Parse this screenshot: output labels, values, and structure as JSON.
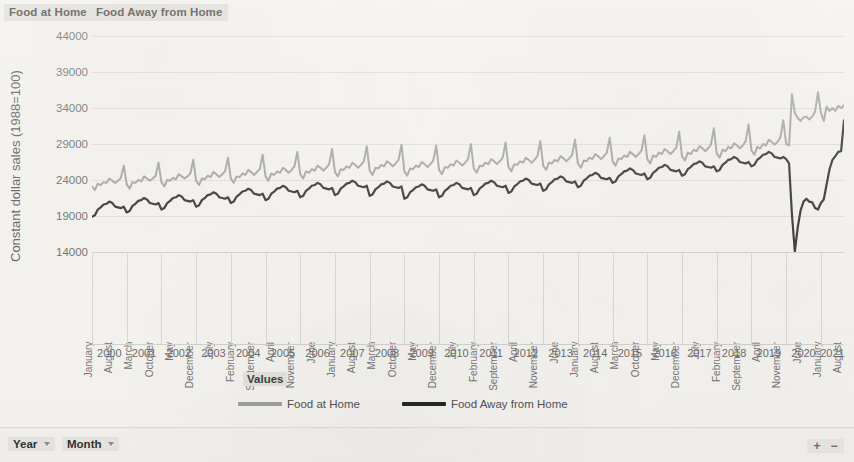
{
  "header": {
    "series_labels": [
      "Food at Home",
      "Food Away from Home"
    ]
  },
  "axes": {
    "y_title": "Constant dollar sales (1988=100)",
    "values_label": "Values"
  },
  "field_bar": {
    "fields": [
      "Year",
      "Month"
    ],
    "zoom_in": "+",
    "zoom_out": "−"
  },
  "chart_data": {
    "type": "line",
    "title": "",
    "xlabel": "",
    "ylabel": "Constant dollar sales (1988=100)",
    "ylim": [
      14000,
      44000
    ],
    "yticks": [
      14000,
      19000,
      24000,
      29000,
      34000,
      39000,
      44000
    ],
    "grid": true,
    "legend_position": "bottom",
    "x_axis": {
      "fields": [
        "Year",
        "Month"
      ],
      "years": [
        2000,
        2001,
        2002,
        2003,
        2004,
        2005,
        2006,
        2007,
        2008,
        2009,
        2010,
        2011,
        2012,
        2013,
        2014,
        2015,
        2016,
        2017,
        2018,
        2019,
        2020,
        2021
      ],
      "month_tick_labels": [
        "January",
        "August",
        "March",
        "October",
        "May",
        "December",
        "July",
        "February",
        "September",
        "April",
        "November",
        "June",
        "January",
        "August",
        "March",
        "October",
        "May",
        "December",
        "July",
        "February",
        "September",
        "April",
        "November",
        "June",
        "January",
        "August",
        "March",
        "October",
        "May",
        "December",
        "July",
        "February",
        "September",
        "April",
        "November",
        "June",
        "January",
        "August"
      ],
      "start": "2000-01",
      "end": "2021-09",
      "points_per_year": 12
    },
    "colors": {
      "food_at_home": "#9b9b9b",
      "food_away_from_home": "#1c1c1c"
    },
    "series": [
      {
        "name": "Food at Home",
        "color": "#9b9b9b",
        "values": [
          23100,
          22600,
          23500,
          23300,
          23700,
          23600,
          24200,
          23900,
          23600,
          23900,
          24300,
          26000,
          23400,
          22800,
          23700,
          23600,
          24000,
          23800,
          24500,
          24200,
          23900,
          24200,
          24600,
          26400,
          23700,
          23100,
          24000,
          23900,
          24300,
          24100,
          24800,
          24500,
          24200,
          24500,
          24900,
          26800,
          23900,
          23300,
          24200,
          24100,
          24600,
          24400,
          25100,
          24800,
          24400,
          24800,
          25200,
          27100,
          24200,
          23600,
          24500,
          24400,
          24900,
          24700,
          25400,
          25100,
          24700,
          25100,
          25500,
          27500,
          24500,
          23900,
          24900,
          24700,
          25200,
          25000,
          25700,
          25400,
          25000,
          25400,
          25900,
          27900,
          24800,
          24200,
          25200,
          25000,
          25500,
          25300,
          26000,
          25700,
          25300,
          25700,
          26200,
          28300,
          25100,
          24500,
          25500,
          25400,
          25900,
          25700,
          26400,
          26100,
          25700,
          26100,
          26600,
          28700,
          25300,
          24700,
          25700,
          25600,
          26100,
          25900,
          26600,
          26300,
          25900,
          26300,
          26800,
          28900,
          25200,
          24600,
          25600,
          25500,
          26000,
          25800,
          26500,
          26200,
          25800,
          26200,
          26700,
          28800,
          25400,
          24800,
          25800,
          25700,
          26200,
          26000,
          26700,
          26400,
          26000,
          26400,
          26900,
          29000,
          25600,
          25000,
          26000,
          25900,
          26400,
          26200,
          26900,
          26600,
          26200,
          26600,
          27100,
          29200,
          25800,
          25200,
          26200,
          26100,
          26600,
          26400,
          27100,
          26800,
          26400,
          26800,
          27300,
          29400,
          26000,
          25400,
          26400,
          26300,
          26800,
          26600,
          27300,
          27000,
          26600,
          27000,
          27500,
          29600,
          26300,
          25700,
          26700,
          26600,
          27100,
          26900,
          27600,
          27300,
          26900,
          27300,
          27800,
          29900,
          26600,
          26000,
          27000,
          26900,
          27400,
          27200,
          27900,
          27600,
          27200,
          27600,
          28100,
          30200,
          26900,
          26300,
          27400,
          27200,
          27800,
          27600,
          28300,
          28000,
          27600,
          28000,
          28500,
          30700,
          27300,
          26700,
          27800,
          27600,
          28200,
          28000,
          28700,
          28400,
          28000,
          28400,
          28900,
          31200,
          27700,
          27100,
          28200,
          28000,
          28600,
          28400,
          29100,
          28800,
          28400,
          28800,
          29400,
          31700,
          28100,
          27500,
          28600,
          28400,
          29000,
          28800,
          29600,
          29300,
          28900,
          29300,
          29900,
          32300,
          29000,
          28800,
          35900,
          33300,
          32600,
          32200,
          32700,
          32800,
          32400,
          32800,
          33500,
          36200,
          33400,
          32200,
          34200,
          33600,
          34000,
          33600,
          34300,
          34000,
          34400
        ]
      },
      {
        "name": "Food Away from Home",
        "color": "#1c1c1c",
        "values": [
          18900,
          19100,
          19900,
          20200,
          20600,
          20700,
          21000,
          20800,
          20300,
          20200,
          20100,
          20300,
          19500,
          19700,
          20400,
          20700,
          21100,
          21200,
          21500,
          21300,
          20800,
          20700,
          20600,
          20800,
          19900,
          20100,
          20800,
          21100,
          21500,
          21600,
          21900,
          21700,
          21200,
          21100,
          21000,
          21200,
          20300,
          20500,
          21200,
          21500,
          21900,
          22000,
          22300,
          22100,
          21600,
          21500,
          21400,
          21600,
          20800,
          21000,
          21700,
          22000,
          22400,
          22500,
          22800,
          22600,
          22100,
          22000,
          21900,
          22100,
          21200,
          21400,
          22100,
          22400,
          22800,
          22900,
          23200,
          23000,
          22500,
          22400,
          22300,
          22500,
          21600,
          21800,
          22500,
          22800,
          23200,
          23300,
          23600,
          23400,
          22900,
          22800,
          22700,
          22900,
          21900,
          22100,
          22800,
          23100,
          23500,
          23600,
          23900,
          23700,
          23200,
          23100,
          23000,
          23200,
          21800,
          22000,
          22700,
          23000,
          23400,
          23500,
          23800,
          23600,
          23100,
          23000,
          22900,
          23100,
          21400,
          21600,
          22300,
          22600,
          23000,
          23100,
          23400,
          23200,
          22700,
          22600,
          22500,
          22700,
          21600,
          21800,
          22500,
          22800,
          23200,
          23300,
          23600,
          23400,
          22900,
          22800,
          22700,
          22900,
          21900,
          22100,
          22800,
          23100,
          23500,
          23600,
          23900,
          23700,
          23200,
          23100,
          23000,
          23200,
          22200,
          22400,
          23100,
          23400,
          23800,
          23900,
          24200,
          24000,
          23500,
          23400,
          23300,
          23500,
          22500,
          22700,
          23400,
          23700,
          24100,
          24200,
          24500,
          24300,
          23800,
          23700,
          23600,
          23800,
          23000,
          23200,
          23900,
          24200,
          24600,
          24700,
          25000,
          24800,
          24300,
          24200,
          24100,
          24300,
          23600,
          23800,
          24500,
          24800,
          25200,
          25300,
          25600,
          25400,
          24900,
          24800,
          24700,
          24900,
          24100,
          24300,
          25000,
          25300,
          25700,
          25800,
          26100,
          25900,
          25400,
          25300,
          25200,
          25400,
          24600,
          24800,
          25500,
          25800,
          26200,
          26300,
          26600,
          26400,
          25900,
          25800,
          25700,
          25900,
          25200,
          25400,
          26100,
          26400,
          26800,
          26900,
          27200,
          27000,
          26500,
          26400,
          26300,
          26500,
          25900,
          26100,
          26800,
          27100,
          27500,
          27600,
          27900,
          27700,
          27200,
          27100,
          27000,
          27200,
          26900,
          26300,
          19200,
          14100,
          17400,
          19800,
          21000,
          21400,
          21000,
          20900,
          20100,
          19900,
          20800,
          21300,
          23400,
          25500,
          26800,
          27300,
          27900,
          28000,
          32300
        ]
      }
    ],
    "annotations": [
      {
        "text": "COVID-19 collapse in food-away-from-home sales",
        "x": "2020-04",
        "y": 14100
      },
      {
        "text": "Offsetting spike in food-at-home sales",
        "x": "2020-03",
        "y": 35900
      }
    ]
  }
}
